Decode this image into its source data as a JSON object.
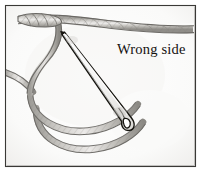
{
  "figure": {
    "title": "Wrong side",
    "kind": "line-drawing",
    "technique": "pencil shading",
    "width_px": 201,
    "height_px": 172,
    "label": "Wrong side",
    "colors": {
      "paper": "#fdfdfd",
      "paper_shadow": "#f2f2f1",
      "frame_border": "#3a3936",
      "frame_border_light": "#c9c8c5",
      "thread_outline": "#6e6c68",
      "thread_fill_light": "#d5d3cf",
      "thread_fill_mid": "#b3b1ac",
      "thread_fill_dark": "#8e8c87",
      "needle_outline": "#15140f",
      "needle_fill": "#fbfbfb",
      "text": "#14110f"
    },
    "elements": [
      {
        "name": "frame-border",
        "role": "decorative border rectangle"
      },
      {
        "name": "paper-background",
        "role": "off-white drawing ground"
      },
      {
        "name": "top-thread",
        "role": "horizontal thread running across the top, tapering to the right"
      },
      {
        "name": "thread-tail-end",
        "role": "frayed hatched thread end at upper left"
      },
      {
        "name": "left-vertical-thread",
        "role": "thread descending and curving from top toward lower left"
      },
      {
        "name": "lower-loop-upper-strand",
        "role": "upper strand of the large bottom loop"
      },
      {
        "name": "lower-loop-lower-strand",
        "role": "lower strand of the large bottom loop"
      },
      {
        "name": "left-exit-thread",
        "role": "thread exiting frame at middle left"
      },
      {
        "name": "needle-body",
        "role": "sewing needle drawn diagonally through the loop"
      },
      {
        "name": "needle-point",
        "role": "sharp tip of the needle at upper left"
      },
      {
        "name": "needle-eye",
        "role": "elongated eye opening near the lower end of the needle"
      },
      {
        "name": "wrong-side-label",
        "role": "caption identifying the wrong side of the fabric"
      }
    ]
  }
}
